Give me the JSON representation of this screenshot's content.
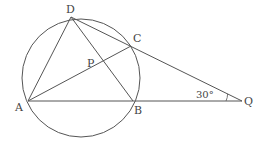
{
  "diagram": {
    "type": "geometry",
    "stroke_color": "#555555",
    "label_color": "#444444",
    "circle": {
      "cx": 81,
      "cy": 78,
      "r": 59
    },
    "points": {
      "A": {
        "label": "A",
        "x": 28,
        "y": 101
      },
      "B": {
        "label": "B",
        "x": 133,
        "y": 101
      },
      "C": {
        "label": "C",
        "x": 131,
        "y": 46
      },
      "D": {
        "label": "D",
        "x": 71,
        "y": 17
      },
      "P": {
        "label": "P",
        "x": 104,
        "y": 71
      },
      "Q": {
        "label": "Q",
        "x": 242,
        "y": 101
      }
    },
    "segments": [
      "D-A",
      "D-B",
      "D-Q",
      "A-C",
      "A-Q"
    ],
    "angle": {
      "vertex": "Q",
      "label": "30°"
    }
  }
}
